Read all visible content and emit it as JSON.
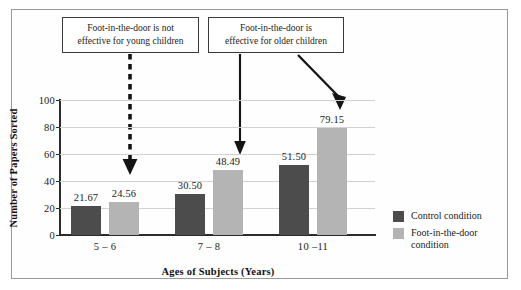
{
  "chart_data": {
    "type": "bar",
    "title": "",
    "xlabel": "Ages of Subjects (Years)",
    "ylabel": "Number of Papers Sorted",
    "categories": [
      "5 – 6",
      "7 – 8",
      "10 –11"
    ],
    "ylim": [
      0,
      100
    ],
    "yticks": [
      0,
      20,
      40,
      60,
      80,
      100
    ],
    "ytick_labels": [
      "0",
      "20",
      "40",
      "60",
      "80",
      "100"
    ],
    "grid": true,
    "legend_position": "right",
    "series": [
      {
        "name": "Control condition",
        "color": "#4c4c4c",
        "values": [
          21.67,
          30.5,
          51.5
        ],
        "labels": [
          "21.67",
          "30.50",
          "51.50"
        ]
      },
      {
        "name": "Foot-in-the-door condition",
        "color": "#b4b4b4",
        "values": [
          24.56,
          48.49,
          79.15
        ],
        "labels": [
          "24.56",
          "48.49",
          "79.15"
        ]
      }
    ],
    "annotations": [
      {
        "id": "annotation-1",
        "line1": "Foot-in-the-door is not",
        "line2": "effective for young children",
        "arrow": "dashed-down-arrow"
      },
      {
        "id": "annotation-2",
        "line1": "Foot-in-the-door is",
        "line2": "effective for older children",
        "arrow": "solid-down-arrow"
      }
    ]
  },
  "legend": {
    "items": [
      {
        "label": "Control condition",
        "color": "#4c4c4c"
      },
      {
        "label": "Foot-in-the-door condition",
        "color": "#b4b4b4"
      }
    ]
  }
}
